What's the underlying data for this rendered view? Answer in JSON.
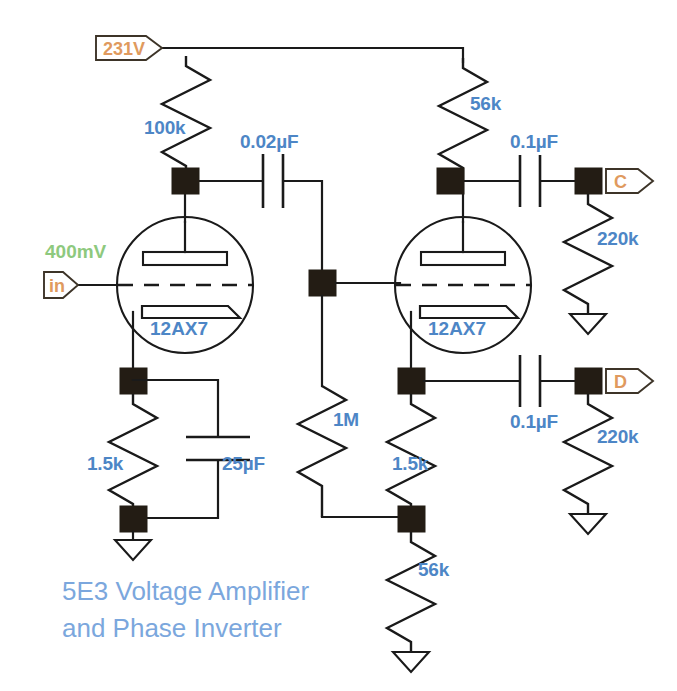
{
  "diagram": {
    "title_line1": "5E3 Voltage Amplifier",
    "title_line2": "and Phase Inverter",
    "colors": {
      "wire": "#1a1a1a",
      "node": "#231c14",
      "value_label": "#4d86c6",
      "tube_label": "#4d86c6",
      "tag_label": "#e09a5e",
      "signal_label": "#8ec97e",
      "title": "#7ba7dd",
      "background": "#ffffff"
    }
  },
  "tags": {
    "supply": "231V",
    "input": "in",
    "input_signal": "400mV",
    "output_c": "C",
    "output_d": "D"
  },
  "tubes": [
    {
      "name": "V1",
      "label": "12AX7"
    },
    {
      "name": "V2",
      "label": "12AX7"
    }
  ],
  "components": {
    "r_plate_v1": "100k",
    "r_plate_v2": "56k",
    "r_cathode_v1": "1.5k",
    "r_cathode_v2": "1.5k",
    "r_grid_v2": "1M",
    "r_tail": "56k",
    "r_load_c": "220k",
    "r_load_d": "220k",
    "c_coupling_in": "0.02µF",
    "c_bypass": "25µF",
    "c_out_c": "0.1µF",
    "c_out_d": "0.1µF"
  }
}
